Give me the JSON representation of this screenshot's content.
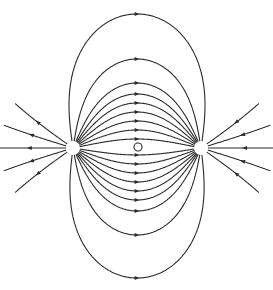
{
  "diagram": {
    "type": "electric-dipole-field-lines",
    "colors": {
      "line": "#2a2a2a",
      "background": "#ffffff"
    },
    "positive_charge": {
      "x": 73,
      "y": 148,
      "r": 7,
      "sign": "+"
    },
    "negative_charge": {
      "x": 201,
      "y": 148,
      "r": 7,
      "sign": "-"
    },
    "midpoint_marker": {
      "x": 138,
      "y": 147,
      "r": 4
    },
    "midline_crossings_y": [
      14,
      59,
      83,
      94,
      103,
      112,
      121,
      130,
      139,
      155,
      164,
      173,
      182,
      191,
      200,
      211,
      235,
      278
    ],
    "outer_line_angles_deg": [
      -145,
      -163,
      180,
      163,
      145
    ],
    "outer_line_length": 66
  }
}
